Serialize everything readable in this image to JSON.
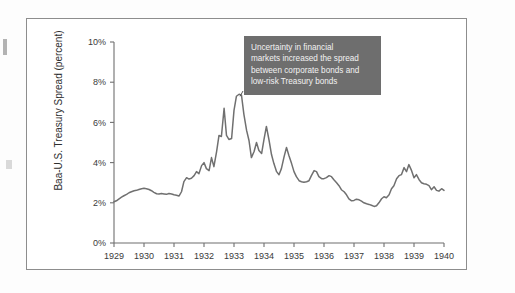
{
  "figure": {
    "annotation": {
      "text": "Uncertainty in financial markets increased the spread between corporate bonds and low-risk Treasury bonds",
      "lines": [
        "Uncertainty in financial",
        "markets increased the spread",
        "between corporate bonds and",
        "low-risk Treasury bonds"
      ],
      "box_color": "#6e6e6e",
      "text_color": "#f2f2f2"
    }
  },
  "chart_data": {
    "type": "line",
    "title": "",
    "xlabel": "",
    "ylabel": "Baa-U.S. Treasury Spread (percent)",
    "xlim": [
      1929,
      1940
    ],
    "ylim": [
      0,
      10
    ],
    "ytick_labels": [
      "0%",
      "2%",
      "4%",
      "6%",
      "8%",
      "10%"
    ],
    "ytick_values": [
      0,
      2,
      4,
      6,
      8,
      10
    ],
    "xtick_labels": [
      "1929",
      "1930",
      "1931",
      "1932",
      "1933",
      "1934",
      "1935",
      "1936",
      "1937",
      "1938",
      "1939",
      "1940"
    ],
    "xtick_values": [
      1929,
      1930,
      1931,
      1932,
      1933,
      1934,
      1935,
      1936,
      1937,
      1938,
      1939,
      1940
    ],
    "grid": false,
    "legend": false,
    "line_color": "#707070",
    "series": [
      {
        "name": "Baa-U.S. Treasury Spread",
        "x": [
          1929.0,
          1929.08,
          1929.17,
          1929.25,
          1929.33,
          1929.42,
          1929.5,
          1929.58,
          1929.67,
          1929.75,
          1929.83,
          1929.92,
          1930.0,
          1930.08,
          1930.17,
          1930.25,
          1930.33,
          1930.42,
          1930.5,
          1930.58,
          1930.67,
          1930.75,
          1930.83,
          1930.92,
          1931.0,
          1931.08,
          1931.17,
          1931.25,
          1931.33,
          1931.42,
          1931.5,
          1931.58,
          1931.67,
          1931.75,
          1931.83,
          1931.92,
          1932.0,
          1932.08,
          1932.17,
          1932.25,
          1932.33,
          1932.42,
          1932.5,
          1932.58,
          1932.67,
          1932.75,
          1932.83,
          1932.92,
          1933.0,
          1933.08,
          1933.17,
          1933.25,
          1933.33,
          1933.42,
          1933.5,
          1933.58,
          1933.67,
          1933.75,
          1933.83,
          1933.92,
          1934.0,
          1934.08,
          1934.17,
          1934.25,
          1934.33,
          1934.42,
          1934.5,
          1934.58,
          1934.67,
          1934.75,
          1934.83,
          1934.92,
          1935.0,
          1935.08,
          1935.17,
          1935.25,
          1935.33,
          1935.42,
          1935.5,
          1935.58,
          1935.67,
          1935.75,
          1935.83,
          1935.92,
          1936.0,
          1936.08,
          1936.17,
          1936.25,
          1936.33,
          1936.42,
          1936.5,
          1936.58,
          1936.67,
          1936.75,
          1936.83,
          1936.92,
          1937.0,
          1937.08,
          1937.17,
          1937.25,
          1937.33,
          1937.42,
          1937.5,
          1937.58,
          1937.67,
          1937.75,
          1937.83,
          1937.92,
          1938.0,
          1938.08,
          1938.17,
          1938.25,
          1938.33,
          1938.42,
          1938.5,
          1938.58,
          1938.67,
          1938.75,
          1938.83,
          1938.92,
          1939.0,
          1939.08,
          1939.17,
          1939.25,
          1939.33,
          1939.42,
          1939.5,
          1939.58,
          1939.67,
          1939.75,
          1939.83,
          1939.92,
          1940.0
        ],
        "values": [
          2.05,
          2.1,
          2.2,
          2.28,
          2.35,
          2.42,
          2.5,
          2.55,
          2.6,
          2.62,
          2.66,
          2.7,
          2.72,
          2.7,
          2.66,
          2.6,
          2.52,
          2.45,
          2.44,
          2.46,
          2.44,
          2.42,
          2.46,
          2.44,
          2.4,
          2.38,
          2.34,
          2.55,
          3.05,
          3.25,
          3.18,
          3.22,
          3.35,
          3.55,
          3.45,
          3.85,
          4.0,
          3.7,
          3.6,
          4.25,
          3.8,
          4.55,
          5.35,
          5.3,
          6.7,
          5.35,
          5.15,
          5.2,
          6.6,
          7.3,
          7.4,
          7.35,
          6.4,
          5.6,
          5.1,
          4.25,
          4.55,
          5.0,
          4.6,
          4.45,
          5.15,
          5.8,
          5.1,
          4.4,
          3.95,
          3.55,
          3.4,
          3.7,
          4.3,
          4.75,
          4.35,
          3.95,
          3.55,
          3.3,
          3.1,
          3.05,
          3.02,
          3.05,
          3.1,
          3.35,
          3.6,
          3.55,
          3.3,
          3.2,
          3.2,
          3.25,
          3.35,
          3.3,
          3.15,
          3.0,
          2.85,
          2.65,
          2.55,
          2.4,
          2.2,
          2.1,
          2.12,
          2.18,
          2.15,
          2.08,
          2.0,
          1.95,
          1.92,
          1.88,
          1.82,
          1.85,
          2.0,
          2.2,
          2.3,
          2.25,
          2.4,
          2.7,
          2.85,
          3.2,
          3.35,
          3.4,
          3.75,
          3.55,
          3.9,
          3.6,
          3.25,
          3.4,
          3.15,
          3.0,
          2.95,
          2.92,
          2.85,
          2.65,
          2.8,
          2.62,
          2.58,
          2.7,
          2.62
        ]
      }
    ]
  }
}
